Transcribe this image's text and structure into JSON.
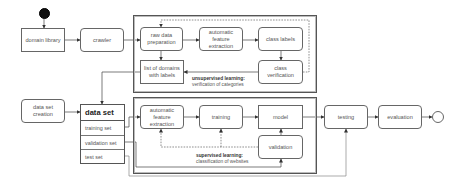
{
  "diagram": {
    "type": "workflow",
    "start": {
      "label": ""
    },
    "end": {
      "label": ""
    },
    "nodes": {
      "domain_library": {
        "label": "domain library"
      },
      "crawler": {
        "label": "crawler"
      },
      "raw_data_preparation": {
        "label": "raw data preparation"
      },
      "auto_feature_extraction_top": {
        "label": "automatic feature extraction"
      },
      "class_labels": {
        "label": "class labels"
      },
      "class_verification": {
        "label": "class verification"
      },
      "list_of_domains": {
        "label": "list of domains with labels"
      },
      "data_set_creation": {
        "label": "data set creation"
      },
      "auto_feature_extraction_bottom": {
        "label": "automatic feature extraction"
      },
      "training": {
        "label": "training"
      },
      "model": {
        "label": "model"
      },
      "validation": {
        "label": "validation"
      },
      "testing": {
        "label": "testing"
      },
      "evaluation": {
        "label": "evaluation"
      }
    },
    "data_set": {
      "title": "data set",
      "rows": [
        "training set",
        "validation set",
        "test set"
      ]
    },
    "groups": {
      "unsupervised": {
        "title": "unsupervised learning:",
        "subtitle": "verification of  categories"
      },
      "supervised": {
        "title": "supervised learning:",
        "subtitle": "classification of websites"
      }
    },
    "edges": [
      [
        "start",
        "domain_library"
      ],
      [
        "domain_library",
        "crawler"
      ],
      [
        "crawler",
        "raw_data_preparation"
      ],
      [
        "raw_data_preparation",
        "auto_feature_extraction_top"
      ],
      [
        "auto_feature_extraction_top",
        "class_labels"
      ],
      [
        "class_labels",
        "class_verification"
      ],
      [
        "class_verification",
        "list_of_domains"
      ],
      [
        "class_verification",
        "raw_data_preparation",
        "dashed"
      ],
      [
        "raw_data_preparation",
        "list_of_domains"
      ],
      [
        "list_of_domains",
        "data_set"
      ],
      [
        "data_set_creation",
        "data_set"
      ],
      [
        "training set",
        "auto_feature_extraction_bottom"
      ],
      [
        "auto_feature_extraction_bottom",
        "training"
      ],
      [
        "training",
        "model"
      ],
      [
        "model",
        "validation"
      ],
      [
        "validation",
        "auto_feature_extraction_bottom",
        "dashed"
      ],
      [
        "validation",
        "training",
        "dashed"
      ],
      [
        "validation set",
        "validation"
      ],
      [
        "model",
        "testing"
      ],
      [
        "test set",
        "testing"
      ],
      [
        "testing",
        "evaluation"
      ],
      [
        "evaluation",
        "end"
      ]
    ]
  }
}
